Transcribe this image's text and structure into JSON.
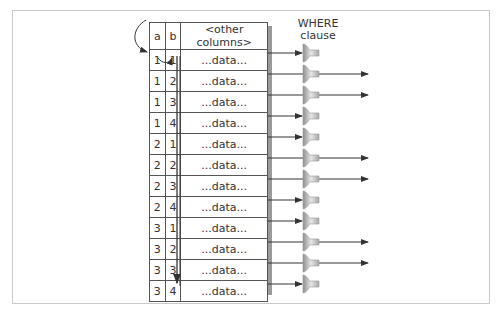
{
  "diagram": {
    "where_label_line1": "WHERE",
    "where_label_line2": "clause",
    "columns": [
      "a",
      "b",
      "<other columns>"
    ],
    "rows": [
      {
        "a": "1",
        "b": "1",
        "data": "...data...",
        "passes": false
      },
      {
        "a": "1",
        "b": "2",
        "data": "...data...",
        "passes": true
      },
      {
        "a": "1",
        "b": "3",
        "data": "...data...",
        "passes": true
      },
      {
        "a": "1",
        "b": "4",
        "data": "...data...",
        "passes": false
      },
      {
        "a": "2",
        "b": "1",
        "data": "...data...",
        "passes": false
      },
      {
        "a": "2",
        "b": "2",
        "data": "...data...",
        "passes": true
      },
      {
        "a": "2",
        "b": "3",
        "data": "...data...",
        "passes": true
      },
      {
        "a": "2",
        "b": "4",
        "data": "...data...",
        "passes": false
      },
      {
        "a": "3",
        "b": "1",
        "data": "...data...",
        "passes": false
      },
      {
        "a": "3",
        "b": "2",
        "data": "...data...",
        "passes": true
      },
      {
        "a": "3",
        "b": "3",
        "data": "...data...",
        "passes": true
      },
      {
        "a": "3",
        "b": "4",
        "data": "...data...",
        "passes": false
      }
    ],
    "icons": {
      "filter": "funnel-icon",
      "scan_arrow": "curved-arrow-icon",
      "down_arrow": "down-arrow-icon"
    },
    "colors": {
      "line": "#333333",
      "funnel": "#b5b5b5",
      "frame": "#c9c9c9"
    }
  }
}
